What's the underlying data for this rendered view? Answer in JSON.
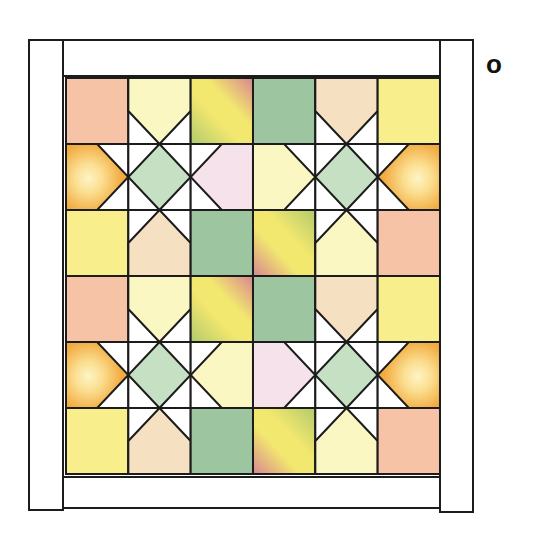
{
  "figure": {
    "label": "o",
    "background": "#ffffff",
    "line_color": "#1c1c1c",
    "stroke_width": 2,
    "palette": {
      "white": "#ffffff",
      "salmon": "#f7c3a6",
      "yellow": "#f8ee8c",
      "pale_yellow": "#fbf7c2",
      "pale_peach": "#f6e0c2",
      "green": "#9cc5a0",
      "diamond_green": "#c6e0c3",
      "pink": "#f6e2ea",
      "orange_glow": "#fdf4c6",
      "orange_mid1": "#fbdf92",
      "orange_mid2": "#f2ac42",
      "orange_edge": "#eda034",
      "grad_green": "#b2ca6c",
      "grad_yellow": "#f2e76f",
      "grad_rose": "#d8868f"
    },
    "frame": {
      "strips": [
        {
          "name": "left",
          "x": 29,
          "y": 40,
          "w": 34,
          "h": 470
        },
        {
          "name": "top",
          "x": 63,
          "y": 40,
          "w": 377,
          "h": 36
        },
        {
          "name": "right",
          "x": 440,
          "y": 40,
          "w": 33,
          "h": 472
        },
        {
          "name": "bottom",
          "x": 63,
          "y": 477,
          "w": 377,
          "h": 31
        }
      ]
    },
    "grid": {
      "x": 66,
      "y": 78,
      "cols": 6,
      "rows": 6,
      "cell_w": 62.33,
      "cell_h": 66,
      "cells": [
        [
          "sq:salmon",
          "pt:down:pale_yellow",
          "gr:tr",
          "sq:green",
          "pt:down:pale_peach",
          "sq:yellow"
        ],
        [
          "pt:right:orange",
          "star",
          "pt:left:pink",
          "pt:right:pale_yellow",
          "star",
          "pt:left:orange"
        ],
        [
          "sq:yellow",
          "pt:up:pale_peach",
          "sq:green",
          "gr:bl",
          "pt:up:pale_yellow",
          "sq:salmon"
        ],
        [
          "sq:salmon",
          "pt:down:pale_yellow",
          "gr:tr",
          "sq:green",
          "pt:down:pale_peach",
          "sq:yellow"
        ],
        [
          "pt:right:orange",
          "star",
          "pt:left:pale_yellow",
          "pt:right:pink",
          "star",
          "pt:left:orange"
        ],
        [
          "sq:yellow",
          "pt:up:pale_peach",
          "sq:green",
          "gr:bl",
          "pt:up:pale_yellow",
          "sq:salmon"
        ]
      ],
      "legend": {
        "sq": "plain square cell",
        "pt": "star-point cell: white background, colored pentagon whose apex points toward the star center",
        "star": "star center cell: white background with green diamond (square on point)",
        "gr:tr": "diagonal gradient square, rose at top-right, green at bottom-left",
        "gr:bl": "diagonal gradient square, rose at bottom-left, green at top-right",
        "orange": "radial orange glow fabric"
      }
    }
  }
}
